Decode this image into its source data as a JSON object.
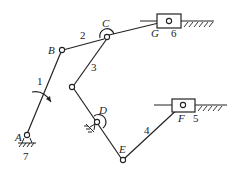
{
  "diagram": {
    "type": "linkage-mechanism",
    "joints": {
      "A": "A",
      "B": "B",
      "C": "C",
      "D": "D",
      "E": "E",
      "F": "F",
      "G": "G"
    },
    "links": {
      "l1": "1",
      "l2": "2",
      "l3": "3",
      "l4": "4",
      "l5": "5",
      "l6": "6",
      "l7": "7"
    }
  }
}
